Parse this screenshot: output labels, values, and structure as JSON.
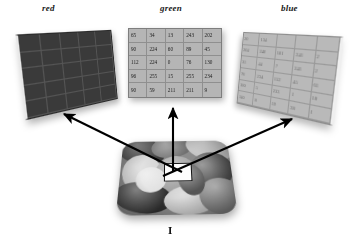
{
  "figure": {
    "caption": "I",
    "planes": {
      "red": {
        "label": "red"
      },
      "green": {
        "label": "green"
      },
      "blue": {
        "label": "blue"
      }
    }
  },
  "chart_data": {
    "type": "table",
    "annotations": [
      "red",
      "green",
      "blue",
      "I"
    ],
    "green_matrix": {
      "label": "green",
      "rows": [
        [
          "65",
          "34",
          "13",
          "243",
          "202"
        ],
        [
          "90",
          "224",
          "60",
          "89",
          "45"
        ],
        [
          "112",
          "224",
          "0",
          "76",
          "130"
        ],
        [
          "96",
          "255",
          "15",
          "255",
          "234"
        ],
        [
          "90",
          "59",
          "211",
          "211",
          "9"
        ]
      ]
    },
    "blue_matrix": {
      "label": "blue",
      "rows": [
        [
          "20",
          "134",
          "",
          "",
          ""
        ],
        [
          "204",
          "240",
          "101",
          "241",
          "2"
        ],
        [
          "33",
          "44",
          "7",
          "241",
          "2"
        ],
        [
          "78",
          "234",
          "152",
          "45",
          "61"
        ],
        [
          "100",
          "5",
          "233",
          "1",
          "18"
        ],
        [
          "140",
          "8",
          "19",
          "38",
          "1"
        ]
      ]
    },
    "red_matrix": {
      "label": "red",
      "rows": [
        [
          "",
          "",
          "",
          "",
          ""
        ],
        [
          "",
          "",
          "",
          "",
          ""
        ],
        [
          "",
          "",
          "",
          "",
          ""
        ],
        [
          "",
          "",
          "",
          "",
          ""
        ],
        [
          "",
          "",
          "",
          "",
          ""
        ]
      ]
    }
  },
  "colors": {
    "background": "#ffffff",
    "red_plane": "#3a3a3a",
    "green_plane": "#b5b5b5",
    "blue_plane": "#b9b9b9",
    "arrow": "#000000",
    "text": "#1a1a1a"
  }
}
